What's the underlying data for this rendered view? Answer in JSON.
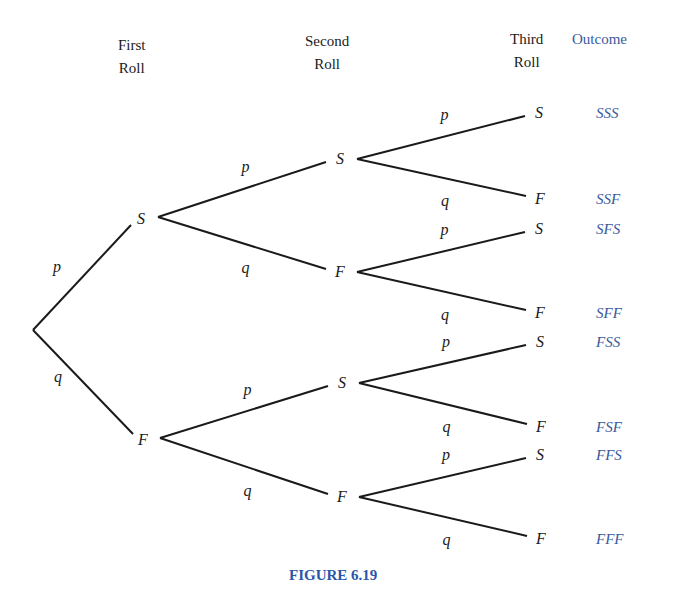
{
  "headers": {
    "first": [
      "First",
      "Roll"
    ],
    "second": [
      "Second",
      "Roll"
    ],
    "third": [
      "Third",
      "Roll"
    ],
    "outcome": "Outcome"
  },
  "nodes": {
    "root": {
      "x": 33,
      "y": 330
    },
    "level1": [
      {
        "label": "S",
        "x": 141,
        "y": 219
      },
      {
        "label": "F",
        "x": 143,
        "y": 440
      }
    ],
    "level2": [
      {
        "label": "S",
        "x": 340,
        "y": 159
      },
      {
        "label": "F",
        "x": 340,
        "y": 272
      },
      {
        "label": "S",
        "x": 342,
        "y": 383
      },
      {
        "label": "F",
        "x": 342,
        "y": 497
      }
    ],
    "level3": [
      {
        "label": "S",
        "x": 539,
        "y": 113
      },
      {
        "label": "F",
        "x": 540,
        "y": 199
      },
      {
        "label": "S",
        "x": 539,
        "y": 229
      },
      {
        "label": "F",
        "x": 540,
        "y": 313
      },
      {
        "label": "S",
        "x": 540,
        "y": 342
      },
      {
        "label": "F",
        "x": 541,
        "y": 427
      },
      {
        "label": "S",
        "x": 540,
        "y": 455
      },
      {
        "label": "F",
        "x": 541,
        "y": 539
      }
    ]
  },
  "branch_labels": {
    "level1": [
      "p",
      "q"
    ],
    "level2": [
      "p",
      "q",
      "p",
      "q"
    ],
    "level3": [
      "p",
      "q",
      "p",
      "q",
      "p",
      "q",
      "p",
      "q"
    ]
  },
  "outcomes": [
    "SSS",
    "SSF",
    "SFS",
    "SFF",
    "FSS",
    "FSF",
    "FFS",
    "FFF"
  ],
  "caption": "FIGURE 6.19",
  "colors": {
    "line": "#1a1a1a",
    "accent": "#3a5a9c",
    "caption": "#2b56a8"
  }
}
